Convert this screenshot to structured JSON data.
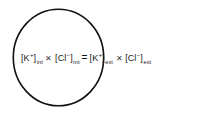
{
  "figure": {
    "name": "donnan-equilibrium-diagram",
    "background_color": "#ffffff",
    "width": 199,
    "height": 115
  },
  "cell": {
    "shape": "ellipse",
    "label": "cell-membrane-circle",
    "stroke_color": "#111111",
    "fill": "none"
  },
  "equation": {
    "full_text": "[K+]int × [Cl−]int = [K+]ext × [Cl−]ext",
    "left_side": {
      "term1": {
        "open_bracket": "[",
        "species": "K",
        "charge": "+",
        "close_bracket": "]",
        "subscript": "int"
      },
      "operator": "✕",
      "term2": {
        "open_bracket": "[",
        "species": "Cl",
        "charge": "−",
        "close_bracket": "]",
        "subscript": "int"
      }
    },
    "relation": "=",
    "right_side": {
      "term1": {
        "open_bracket": "[",
        "species": "K",
        "charge": "+",
        "close_bracket": "]",
        "subscript": "ext"
      },
      "operator": "✕",
      "term2": {
        "open_bracket": "[",
        "species": "Cl",
        "charge": "−",
        "close_bracket": "]",
        "subscript": "ext"
      }
    }
  }
}
